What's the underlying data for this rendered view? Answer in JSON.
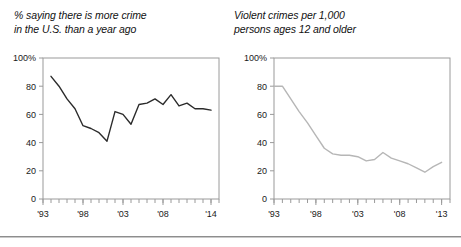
{
  "page": {
    "background_color": "#ffffff",
    "bottom_rule_color": "#8d8d8d"
  },
  "charts": [
    {
      "panel_name": "left-chart-panel",
      "title_line1": "% saying there is more crime",
      "title_line2": "in the U.S. than a year ago",
      "line_color": "#2b2b2b",
      "axis_color": "#9a9a9a",
      "y_ticks": [
        "100%",
        "80",
        "60",
        "40",
        "20",
        "0"
      ],
      "x_ticks": [
        "'93",
        "'98",
        "'03",
        "'08",
        "'14"
      ]
    },
    {
      "panel_name": "right-chart-panel",
      "title_line1": "Violent crimes per 1,000",
      "title_line2": "persons ages 12 and older",
      "line_color": "#b6b6b6",
      "axis_color": "#9a9a9a",
      "y_ticks": [
        "100%",
        "80",
        "60",
        "40",
        "20",
        "0"
      ],
      "x_ticks": [
        "'93",
        "'98",
        "'03",
        "'08",
        "'13"
      ]
    }
  ],
  "chart_data": [
    {
      "type": "line",
      "name": "more-crime-opinion",
      "title": "% saying there is more crime in the U.S. than a year ago",
      "xlabel": "",
      "ylabel": "",
      "xlim": [
        1993,
        2015
      ],
      "ylim": [
        0,
        100
      ],
      "y_ticks": [
        0,
        20,
        40,
        60,
        80,
        100
      ],
      "y_tick_labels": [
        "0",
        "20",
        "40",
        "60",
        "80",
        "100%"
      ],
      "x_tick_years": [
        1993,
        1998,
        2003,
        2008,
        2014
      ],
      "x_tick_labels": [
        "'93",
        "'98",
        "'03",
        "'08",
        "'14"
      ],
      "grid": false,
      "legend": "none",
      "line_color": "#2b2b2b",
      "x": [
        1994,
        1995,
        1996,
        1997,
        1998,
        1999,
        2000,
        2001,
        2002,
        2003,
        2004,
        2005,
        2006,
        2007,
        2008,
        2009,
        2010,
        2011,
        2012,
        2013,
        2014
      ],
      "values": [
        87,
        80,
        71,
        64,
        52,
        50,
        47,
        41,
        62,
        60,
        53,
        67,
        68,
        71,
        67,
        74,
        66,
        68,
        64,
        64,
        63
      ]
    },
    {
      "type": "line",
      "name": "violent-crime-rate",
      "title": "Violent crimes per 1,000 persons ages 12 and older",
      "xlabel": "",
      "ylabel": "",
      "xlim": [
        1993,
        2014
      ],
      "ylim": [
        0,
        100
      ],
      "y_ticks": [
        0,
        20,
        40,
        60,
        80,
        100
      ],
      "y_tick_labels": [
        "0",
        "20",
        "40",
        "60",
        "80",
        "100%"
      ],
      "x_tick_years": [
        1993,
        1998,
        2003,
        2008,
        2013
      ],
      "x_tick_labels": [
        "'93",
        "'98",
        "'03",
        "'08",
        "'13"
      ],
      "grid": false,
      "legend": "none",
      "line_color": "#b6b6b6",
      "x": [
        1993,
        1994,
        1995,
        1996,
        1997,
        1998,
        1999,
        2000,
        2001,
        2002,
        2003,
        2004,
        2005,
        2006,
        2007,
        2008,
        2009,
        2010,
        2011,
        2012,
        2013
      ],
      "values": [
        80,
        80,
        71,
        62,
        54,
        45,
        36,
        32,
        31,
        31,
        30,
        27,
        28,
        33,
        29,
        27,
        25,
        22,
        19,
        23,
        26,
        22
      ]
    }
  ]
}
